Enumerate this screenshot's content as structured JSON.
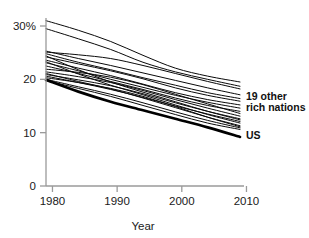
{
  "chart_data": {
    "type": "line",
    "title": "",
    "xlabel": "Year",
    "ylabel": "",
    "xlim": [
      1979,
      2009
    ],
    "ylim": [
      0,
      32.5
    ],
    "grid": false,
    "legend_position": "right-inline",
    "x_ticks": [
      "1980",
      "1990",
      "2000",
      "2010"
    ],
    "x_tick_values": [
      1980,
      1990,
      2000,
      2010
    ],
    "y_ticks": [
      "0",
      "10",
      "20",
      "30%"
    ],
    "y_tick_values": [
      0,
      10,
      20,
      30
    ],
    "x": [
      1979,
      1984,
      1989,
      1994,
      1999,
      2004,
      2009
    ],
    "annotations": [
      {
        "text": "19 other",
        "x": 2010,
        "y": 16.8
      },
      {
        "text": "rich nations",
        "x": 2010,
        "y": 14.9
      },
      {
        "text": "US",
        "x": 2010,
        "y": 9.6
      }
    ],
    "series": [
      {
        "name": "rich-nation-1",
        "emphasis": "normal",
        "values": [
          31.0,
          29.2,
          27.1,
          24.5,
          22.1,
          20.6,
          19.5
        ]
      },
      {
        "name": "rich-nation-2",
        "emphasis": "normal",
        "values": [
          29.5,
          27.6,
          25.6,
          23.2,
          21.4,
          20.0,
          18.7
        ]
      },
      {
        "name": "rich-nation-3",
        "emphasis": "normal",
        "values": [
          25.1,
          24.6,
          23.9,
          22.6,
          21.1,
          19.6,
          18.2
        ]
      },
      {
        "name": "rich-nation-4",
        "emphasis": "normal",
        "values": [
          25.3,
          23.9,
          22.6,
          21.2,
          19.8,
          18.4,
          17.1
        ]
      },
      {
        "name": "rich-nation-5",
        "emphasis": "normal",
        "values": [
          24.8,
          23.2,
          21.8,
          20.3,
          18.9,
          17.5,
          16.4
        ]
      },
      {
        "name": "rich-nation-6",
        "emphasis": "normal",
        "values": [
          24.2,
          22.9,
          21.6,
          20.1,
          18.4,
          17.0,
          15.9
        ]
      },
      {
        "name": "rich-nation-7",
        "emphasis": "normal",
        "values": [
          23.6,
          22.1,
          20.7,
          19.1,
          17.5,
          16.2,
          15.2
        ]
      },
      {
        "name": "rich-nation-8",
        "emphasis": "normal",
        "values": [
          23.1,
          21.6,
          20.0,
          18.5,
          17.0,
          15.7,
          14.6
        ]
      },
      {
        "name": "rich-nation-9",
        "emphasis": "normal",
        "values": [
          22.5,
          21.1,
          19.6,
          18.1,
          16.5,
          15.1,
          14.0
        ]
      },
      {
        "name": "rich-nation-10",
        "emphasis": "normal",
        "values": [
          21.9,
          21.3,
          20.4,
          19.0,
          17.2,
          15.4,
          13.6
        ]
      },
      {
        "name": "rich-nation-11",
        "emphasis": "normal",
        "values": [
          21.4,
          20.5,
          19.4,
          17.9,
          16.2,
          14.6,
          13.1
        ]
      },
      {
        "name": "rich-nation-12",
        "emphasis": "normal",
        "values": [
          20.9,
          19.9,
          18.8,
          17.3,
          15.6,
          14.0,
          12.6
        ]
      },
      {
        "name": "rich-nation-13",
        "emphasis": "normal",
        "values": [
          20.6,
          19.4,
          18.1,
          16.6,
          15.0,
          13.5,
          12.1
        ]
      },
      {
        "name": "rich-nation-14",
        "emphasis": "normal",
        "values": [
          24.4,
          21.8,
          19.5,
          17.6,
          15.8,
          14.0,
          12.4
        ]
      },
      {
        "name": "rich-nation-15",
        "emphasis": "normal",
        "values": [
          23.3,
          21.0,
          18.9,
          17.1,
          15.2,
          13.4,
          11.8
        ]
      },
      {
        "name": "rich-nation-16",
        "emphasis": "normal",
        "values": [
          21.1,
          19.6,
          18.2,
          16.5,
          14.7,
          12.9,
          11.3
        ]
      },
      {
        "name": "rich-nation-17",
        "emphasis": "normal",
        "values": [
          20.3,
          19.4,
          18.3,
          16.8,
          14.9,
          12.9,
          11.1
        ]
      },
      {
        "name": "rich-nation-18",
        "emphasis": "normal",
        "values": [
          20.0,
          18.6,
          17.2,
          15.6,
          13.9,
          12.3,
          10.9
        ]
      },
      {
        "name": "rich-nation-19",
        "emphasis": "normal",
        "values": [
          19.8,
          18.3,
          16.8,
          15.1,
          13.4,
          11.8,
          10.6
        ]
      },
      {
        "name": "US",
        "emphasis": "bold",
        "values": [
          19.9,
          17.7,
          15.8,
          14.2,
          12.6,
          11.0,
          9.2
        ]
      }
    ]
  }
}
